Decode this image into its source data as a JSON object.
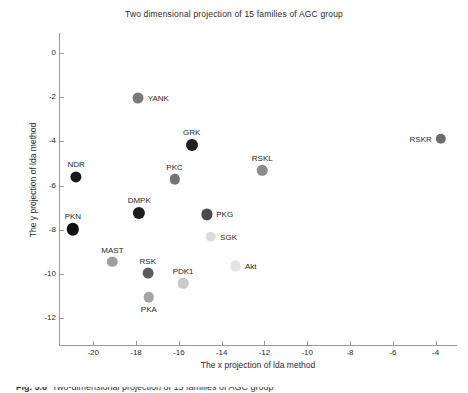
{
  "chart_data": {
    "type": "scatter",
    "title": "Two dimensional projection of 15 families of AGC group",
    "xlabel": "The x projection of lda method",
    "ylabel": "The y projection of lda method",
    "xlim": [
      -21.6,
      -3.0
    ],
    "ylim": [
      -13.2,
      0.9
    ],
    "xticks": [
      -20,
      -18,
      -16,
      -14,
      -12,
      -10,
      -8,
      -6,
      -4
    ],
    "yticks": [
      0,
      -2,
      -4,
      -6,
      -8,
      -10,
      -12
    ],
    "xtick_labels": [
      "-20",
      "-18",
      "-16",
      "-14",
      "-12",
      "-10",
      "-8",
      "-6",
      "-4"
    ],
    "ytick_labels": [
      "0",
      "-2",
      "-4",
      "-6",
      "-8",
      "-10",
      "-12"
    ],
    "grid": false,
    "legend": "none",
    "points": [
      {
        "label": "YANK",
        "x": -17.9,
        "y": -2.05,
        "color": "#7a7a7a",
        "r": 5.5,
        "label_pos": "right"
      },
      {
        "label": "GRK",
        "x": -15.4,
        "y": -4.15,
        "color": "#1f1f1f",
        "r": 6.0,
        "label_pos": "above"
      },
      {
        "label": "RSKR",
        "x": -3.75,
        "y": -3.88,
        "color": "#6d6d6d",
        "r": 5.2,
        "label_pos": "left"
      },
      {
        "label": "NDR",
        "x": -20.8,
        "y": -5.6,
        "color": "#191919",
        "r": 5.6,
        "label_pos": "above"
      },
      {
        "label": "RSKL",
        "x": -12.1,
        "y": -5.3,
        "color": "#8b8b8b",
        "r": 5.3,
        "label_pos": "above"
      },
      {
        "label": "PKC",
        "x": -16.2,
        "y": -5.72,
        "color": "#747474",
        "r": 5.2,
        "label_pos": "above"
      },
      {
        "label": "DMPK",
        "x": -17.85,
        "y": -7.22,
        "color": "#1c1c1c",
        "r": 6.1,
        "label_pos": "above"
      },
      {
        "label": "PKG",
        "x": -14.7,
        "y": -7.3,
        "color": "#4a4a4a",
        "r": 5.6,
        "label_pos": "right"
      },
      {
        "label": "PKN",
        "x": -20.95,
        "y": -7.98,
        "color": "#101010",
        "r": 6.2,
        "label_pos": "above"
      },
      {
        "label": "SGK",
        "x": -14.5,
        "y": -8.3,
        "color": "#dcdcdc",
        "r": 5.2,
        "label_pos": "right"
      },
      {
        "label": "MAST",
        "x": -19.1,
        "y": -9.45,
        "color": "#9f9f9f",
        "r": 5.2,
        "label_pos": "above"
      },
      {
        "label": "Akt",
        "x": -13.35,
        "y": -9.65,
        "color": "#e2e2e2",
        "r": 5.4,
        "label_pos": "right"
      },
      {
        "label": "RSK",
        "x": -17.45,
        "y": -9.95,
        "color": "#5c5c5c",
        "r": 5.4,
        "label_pos": "above"
      },
      {
        "label": "PDK1",
        "x": -15.8,
        "y": -10.42,
        "color": "#c9c9c9",
        "r": 5.3,
        "label_pos": "above"
      },
      {
        "label": "PKA",
        "x": -17.4,
        "y": -11.05,
        "color": "#a5a5a5",
        "r": 5.3,
        "label_pos": "below"
      }
    ]
  },
  "caption": {
    "figure_number": "Fig. 5.6",
    "text": "Two-dimensional projection of 15 families of AGC group"
  }
}
